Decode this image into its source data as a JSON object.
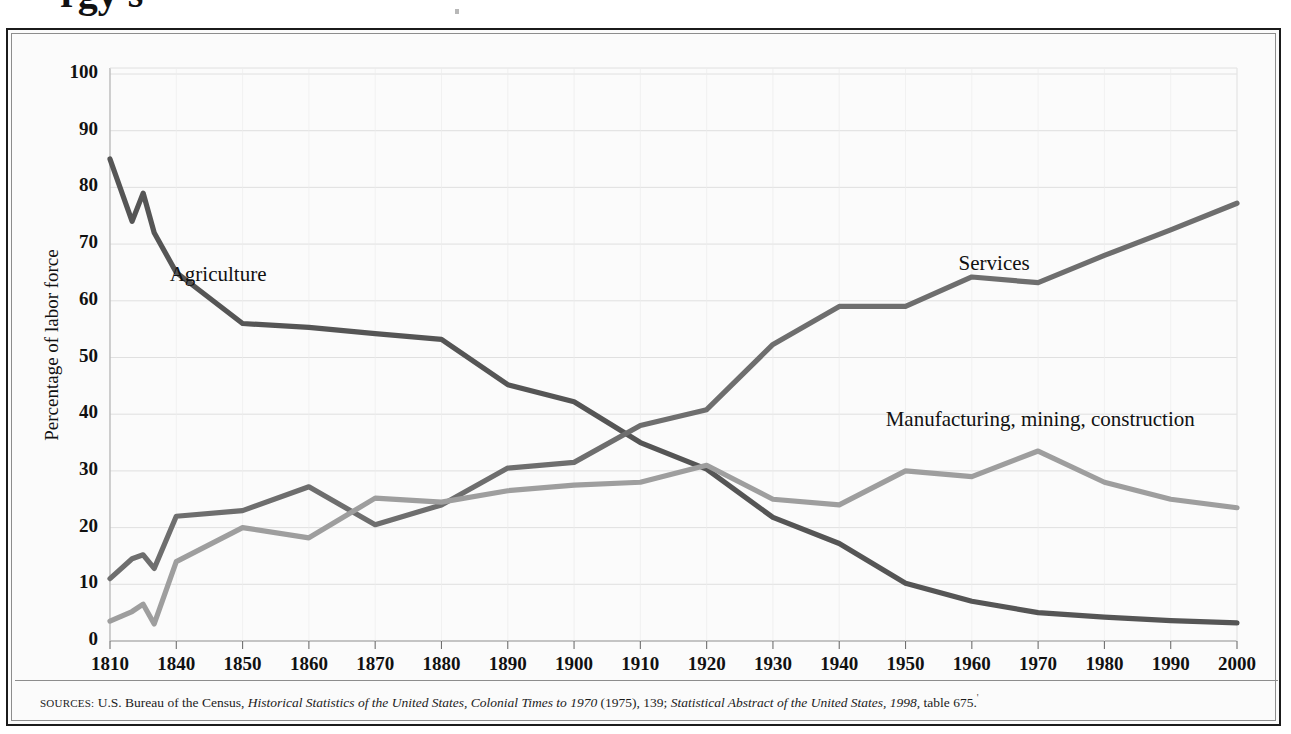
{
  "figure": {
    "clipped_title": "rgy s",
    "y_axis_title": "Percentage of labor force",
    "source_prefix": "SOURCES:",
    "source_part1": " U.S. Bureau of the Census, ",
    "source_italic1": "Historical Statistics of the United States, Colonial Times to 1970",
    "source_part2": " (1975), 139; ",
    "source_italic2": "Statistical Abstract of the United States, 1998",
    "source_part3": ", table 675.",
    "background_color": "#fbfbfb",
    "border_color": "#1b1b1b",
    "grid_color": "#d8d8d8"
  },
  "chart_data": {
    "type": "line",
    "title": "",
    "subtitle": "",
    "xlabel": "",
    "ylabel": "Percentage of labor force",
    "xlim": [
      1810,
      2000
    ],
    "ylim": [
      0,
      100
    ],
    "grid": true,
    "legend_position": "inline-labels",
    "y_ticks": [
      0,
      10,
      20,
      30,
      40,
      50,
      60,
      70,
      80,
      90,
      100
    ],
    "y_tick_labels": [
      "0",
      "10",
      "20",
      "30",
      "40",
      "50",
      "60",
      "70",
      "80",
      "90",
      "100"
    ],
    "x_ticks": [
      1810,
      1840,
      1850,
      1860,
      1870,
      1880,
      1890,
      1900,
      1910,
      1920,
      1930,
      1940,
      1950,
      1960,
      1970,
      1980,
      1990,
      2000
    ],
    "x_tick_labels": [
      "1810",
      "1840",
      "1850",
      "1860",
      "1870",
      "1880",
      "1890",
      "1900",
      "1910",
      "1920",
      "1930",
      "1940",
      "1950",
      "1960",
      "1970",
      "1980",
      "1990",
      "2000"
    ],
    "series": [
      {
        "name": "Agriculture",
        "color": "#555555",
        "label_x": 1837,
        "label_y": 64.5,
        "x": [
          1810,
          1820,
          1825,
          1830,
          1840,
          1850,
          1860,
          1870,
          1880,
          1890,
          1900,
          1910,
          1920,
          1930,
          1940,
          1950,
          1960,
          1970,
          1980,
          1990,
          2000
        ],
        "values": [
          85,
          74,
          79,
          72,
          65,
          56,
          55.3,
          54.2,
          53.2,
          45.2,
          42.2,
          35,
          30.3,
          21.8,
          17.2,
          10.2,
          7,
          5,
          4.2,
          3.6,
          3.2
        ]
      },
      {
        "name": "Services",
        "color": "#6e6e6e",
        "label_x": 1958,
        "label_y": 66.5,
        "x": [
          1810,
          1820,
          1825,
          1830,
          1840,
          1850,
          1860,
          1870,
          1880,
          1890,
          1900,
          1910,
          1920,
          1930,
          1940,
          1950,
          1960,
          1970,
          1980,
          1990,
          2000
        ],
        "values": [
          11,
          14.5,
          15.2,
          12.8,
          22,
          23,
          27.2,
          20.5,
          24,
          30.5,
          31.5,
          38,
          40.8,
          52.3,
          59,
          59,
          64.2,
          63.2,
          68,
          72.5,
          77.2
        ]
      },
      {
        "name": "Manufacturing, mining, construction",
        "color": "#9e9e9e",
        "label_x": 1947,
        "label_y": 39,
        "x": [
          1810,
          1820,
          1825,
          1830,
          1840,
          1850,
          1860,
          1870,
          1880,
          1890,
          1900,
          1910,
          1920,
          1930,
          1940,
          1950,
          1960,
          1970,
          1980,
          1990,
          2000
        ],
        "values": [
          3.5,
          5.2,
          6.5,
          3,
          14,
          20,
          18.2,
          25.2,
          24.5,
          26.5,
          27.5,
          28,
          31,
          25,
          24,
          30,
          29,
          33.5,
          28,
          25,
          23.5
        ]
      }
    ]
  }
}
